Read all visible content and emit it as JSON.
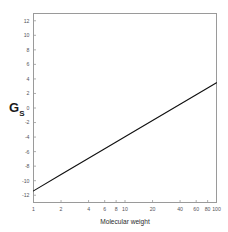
{
  "figure": {
    "background_color": "#ffffff",
    "frame_color": "#9a9a9a",
    "line_color": "#111111"
  },
  "axis_titles": {
    "x": "Molecular weight",
    "y_main": "G",
    "y_subscript": "S"
  },
  "chart_data": {
    "type": "line",
    "title": "",
    "xlabel": "Molecular weight",
    "ylabel": "G_S",
    "xscale": "log",
    "yscale": "linear",
    "xlim": [
      1,
      100
    ],
    "ylim": [
      -13,
      13
    ],
    "grid": false,
    "legend": false,
    "xticks": [
      1,
      2,
      4,
      6,
      8,
      10,
      20,
      40,
      60,
      80,
      100
    ],
    "xticklabels": [
      "1",
      "2",
      "4",
      "6",
      "8",
      "10",
      "20",
      "40",
      "60",
      "80",
      "100"
    ],
    "yticks": [
      -12,
      -10,
      -8,
      -6,
      -4,
      -2,
      0,
      2,
      4,
      6,
      8,
      10,
      12
    ],
    "yticklabels": [
      "-12",
      "-10",
      "-8",
      "-6",
      "-4",
      "-2",
      "0",
      "2",
      "4",
      "6",
      "8",
      "10",
      "12"
    ],
    "series": [
      {
        "name": "G_S",
        "x": [
          1,
          2,
          4,
          6,
          8,
          10,
          20,
          40,
          60,
          80,
          100
        ],
        "y": [
          -11.4,
          -9.16,
          -6.92,
          -5.6,
          -4.68,
          -3.97,
          -1.73,
          0.51,
          1.82,
          2.75,
          3.47
        ]
      }
    ],
    "annotations": []
  }
}
